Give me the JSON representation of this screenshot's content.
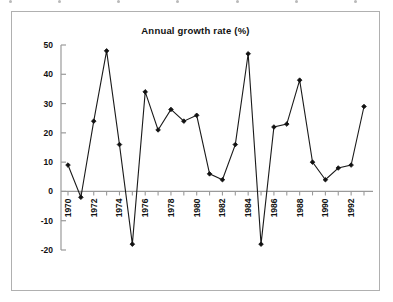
{
  "chart_data": {
    "type": "line",
    "title": "Annual growth rate (%)",
    "xlabel": "",
    "ylabel": "",
    "x": [
      1970,
      1971,
      1972,
      1973,
      1974,
      1975,
      1976,
      1977,
      1978,
      1979,
      1980,
      1981,
      1982,
      1983,
      1984,
      1985,
      1986,
      1987,
      1988,
      1989,
      1990,
      1991,
      1992,
      1993
    ],
    "values": [
      9,
      -2,
      24,
      48,
      16,
      -18,
      34,
      21,
      28,
      24,
      26,
      6,
      4,
      16,
      47,
      -18,
      22,
      23,
      38,
      10,
      4,
      8,
      9,
      29
    ],
    "series": [
      {
        "name": "Annual growth rate (%)",
        "values": [
          9,
          -2,
          24,
          48,
          16,
          -18,
          34,
          21,
          28,
          24,
          26,
          6,
          4,
          16,
          47,
          -18,
          22,
          23,
          38,
          10,
          4,
          8,
          9,
          29
        ]
      }
    ],
    "ylim": [
      -20,
      50
    ],
    "yticks": [
      50,
      40,
      30,
      20,
      10,
      0,
      -10,
      -20
    ],
    "ytick_labels": [
      "50",
      "40",
      "30",
      "20",
      "10",
      "0",
      "-10",
      "-20"
    ],
    "xtick_values": [
      1970,
      1972,
      1974,
      1976,
      1978,
      1980,
      1982,
      1984,
      1986,
      1988,
      1990,
      1992
    ],
    "xtick_labels": [
      "1970",
      "1972",
      "1974",
      "1976",
      "1978",
      "1980",
      "1982",
      "1984",
      "1986",
      "1988",
      "1990",
      "1992"
    ],
    "grid": false,
    "legend": "none",
    "line_color": "#1a1a1a",
    "marker": "diamond",
    "marker_color": "#111111",
    "axis_color": "#9a9a9a",
    "frame_color": "#b0b0b0",
    "background": "#ffffff"
  }
}
